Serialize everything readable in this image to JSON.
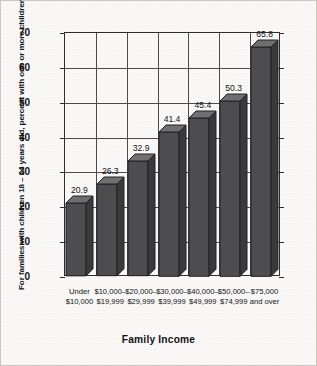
{
  "chart_data": {
    "type": "bar",
    "title": "",
    "xlabel": "Family Income",
    "ylabel": "For families with children 18 – 24 years old, percent with one or more children attending college full time",
    "categories": [
      "Under\n$10,000",
      "$10,000–\n$19,999",
      "$20,000–\n$29,999",
      "$30,000–\n$39,999",
      "$40,000–\n$49,999",
      "$50,000–\n$74,999",
      "$75,000\nand over"
    ],
    "values": [
      20.9,
      26.3,
      32.9,
      41.4,
      45.4,
      50.3,
      65.8
    ],
    "value_labels": [
      "20.9",
      "26.3",
      "32.9",
      "41.4",
      "45.4",
      "50.3",
      "65.8"
    ],
    "ylim": [
      0,
      70
    ],
    "ytick_labels": [
      "0",
      "10",
      "20",
      "30",
      "40",
      "50",
      "60",
      "70"
    ],
    "ytick_values": [
      0,
      10,
      20,
      30,
      40,
      50,
      60,
      70
    ],
    "grid": true,
    "legend": null,
    "style": "3d-bar",
    "colors": {
      "bar_front": "#4d4d4f",
      "bar_top": "#6f6f71",
      "bar_side": "#3a3a3c",
      "bar_outline": "#232325",
      "grid": "#4b4b4e",
      "axis": "#2d2d30",
      "background": "#faf9f7",
      "text": "#121214"
    }
  }
}
